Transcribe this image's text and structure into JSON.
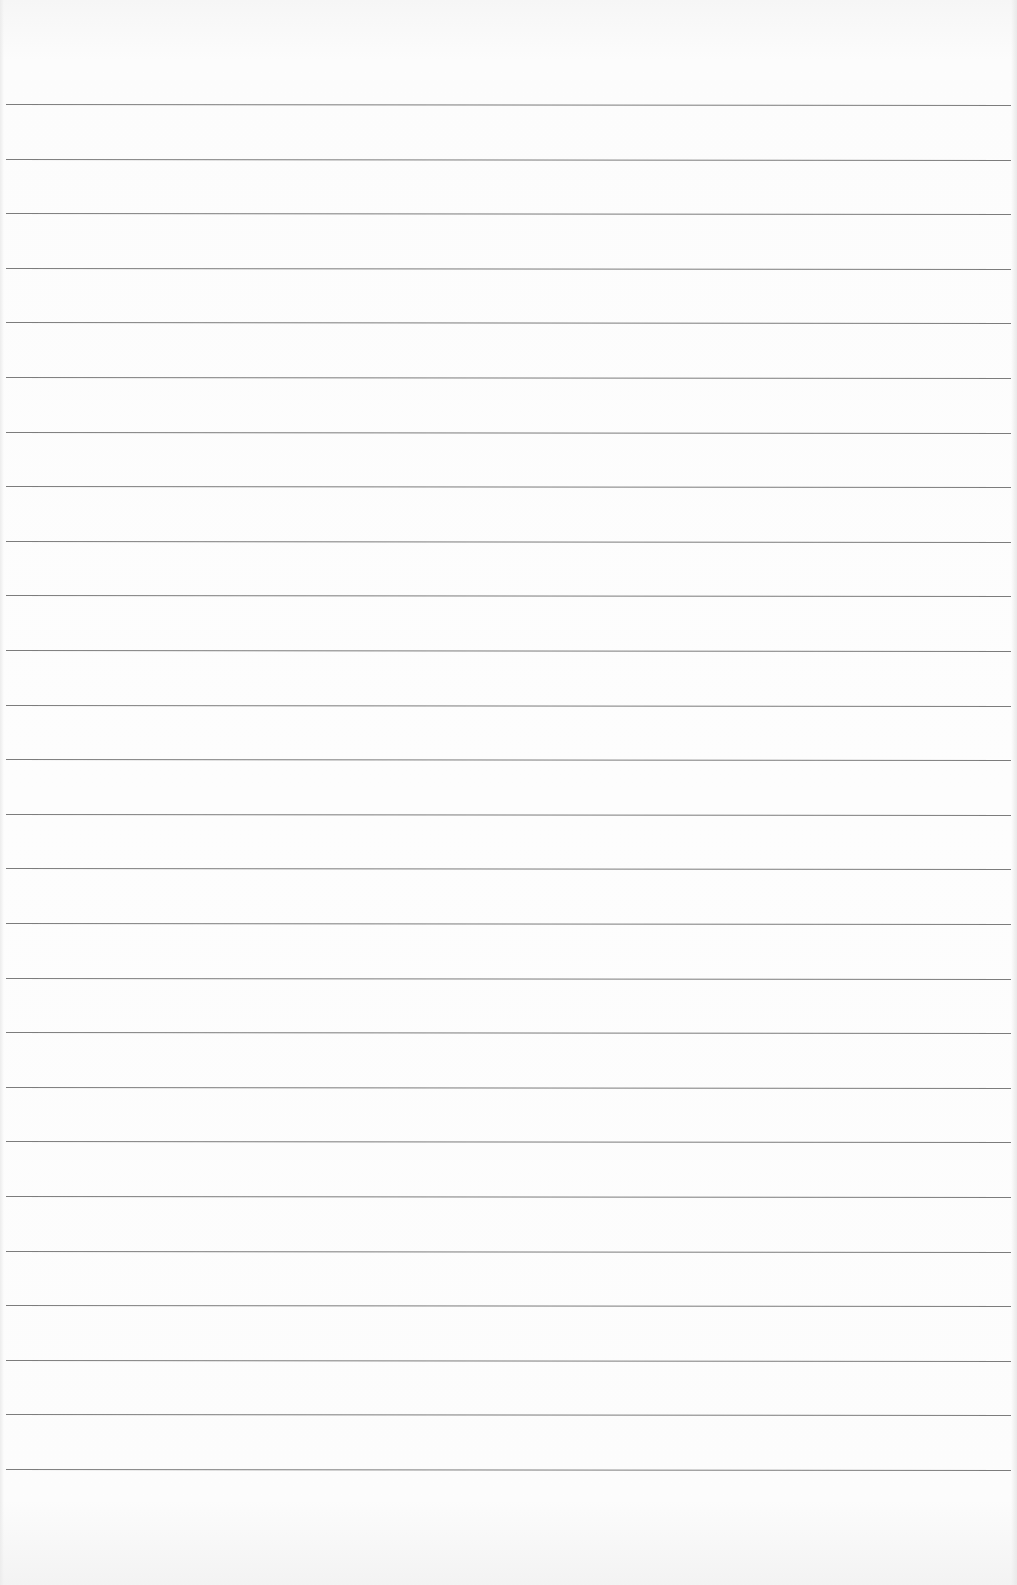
{
  "page": {
    "type": "ruled-paper",
    "background_color": "#fbfbfb",
    "line_color": "#6e6e6e",
    "line_count": 26,
    "first_line_y": 104,
    "line_spacing": 54.6
  },
  "text": []
}
